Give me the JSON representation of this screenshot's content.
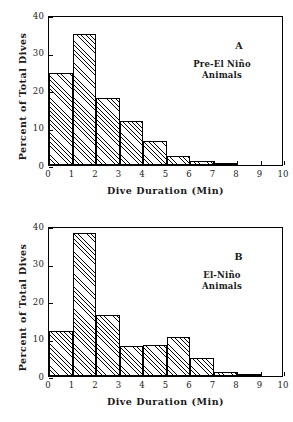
{
  "figure": {
    "background": "#ffffff",
    "ink_color": "#000000"
  },
  "chart_data": [
    {
      "type": "bar",
      "panel": "A",
      "panel_letter": "A",
      "caption_line1": "Pre-El Niño",
      "caption_line2": "Animals",
      "title": "",
      "xlabel": "Dive Duration (Min)",
      "ylabel": "Percent of Total Dives",
      "xlim": [
        0,
        10
      ],
      "ylim": [
        0,
        40
      ],
      "xticks": [
        "0",
        "1",
        "2",
        "3",
        "4",
        "5",
        "6",
        "7",
        "8",
        "9",
        "10"
      ],
      "yticks": [
        "0",
        "10",
        "20",
        "30",
        "40"
      ],
      "grid": false,
      "legend": "none",
      "bin_edges": [
        0,
        1,
        2,
        3,
        4,
        5,
        6,
        7,
        8,
        9,
        10
      ],
      "categories": [
        "0-1",
        "1-2",
        "2-3",
        "3-4",
        "4-5",
        "5-6",
        "6-7",
        "7-8",
        "8-9",
        "9-10"
      ],
      "values": [
        24.5,
        35.0,
        18.0,
        11.7,
        6.4,
        2.5,
        1.0,
        0.3,
        0,
        0
      ]
    },
    {
      "type": "bar",
      "panel": "B",
      "panel_letter": "B",
      "caption_line1": "El-Niño",
      "caption_line2": "Animals",
      "title": "",
      "xlabel": "Dive Duration (Min)",
      "ylabel": "Percent of Total Dives",
      "xlim": [
        0,
        10
      ],
      "ylim": [
        0,
        40
      ],
      "xticks": [
        "0",
        "1",
        "2",
        "3",
        "4",
        "5",
        "6",
        "7",
        "8",
        "9",
        "10"
      ],
      "yticks": [
        "0",
        "10",
        "20",
        "30",
        "40"
      ],
      "grid": false,
      "legend": "none",
      "bin_edges": [
        0,
        1,
        2,
        3,
        4,
        5,
        6,
        7,
        8,
        9,
        10
      ],
      "categories": [
        "0-1",
        "1-2",
        "2-3",
        "3-4",
        "4-5",
        "5-6",
        "6-7",
        "7-8",
        "8-9",
        "9-10"
      ],
      "values": [
        12.0,
        38.2,
        16.4,
        7.9,
        8.3,
        10.3,
        4.9,
        1.0,
        0.3,
        0
      ]
    }
  ]
}
